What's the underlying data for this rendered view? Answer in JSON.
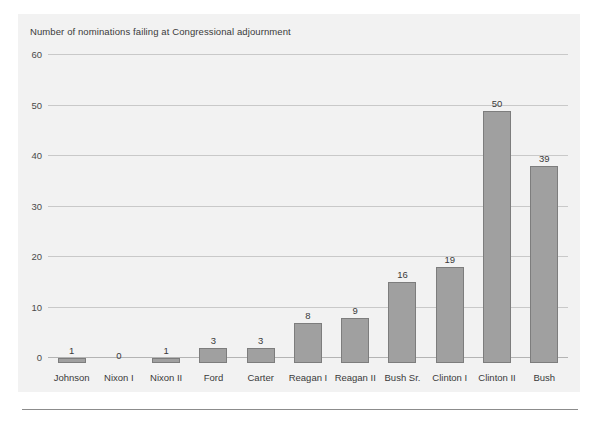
{
  "figure": {
    "title": "Number of nominations failing at Congressional adjournment"
  },
  "colors": {
    "panel_background": "#f2f2f2",
    "bar_fill": "#a0a0a0",
    "bar_border": "#7d7d7d",
    "gridline": "#c9c9c9",
    "baseline": "#b4b4b4",
    "text": "#3a3a3a",
    "bottom_rule": "#8c8c8c"
  },
  "chart_data": {
    "type": "bar",
    "title": "Number of nominations failing at Congressional adjournment",
    "xlabel": "",
    "ylabel": "",
    "ylim": [
      0,
      60
    ],
    "yticks": [
      0,
      10,
      20,
      30,
      40,
      50,
      60
    ],
    "ytick_labels": [
      "0",
      "10",
      "20",
      "30",
      "40",
      "50",
      "60"
    ],
    "grid": true,
    "legend": false,
    "data_labels": true,
    "categories": [
      "Johnson",
      "Nixon I",
      "Nixon II",
      "Ford",
      "Carter",
      "Reagan I",
      "Reagan II",
      "Bush Sr.",
      "Clinton I",
      "Clinton II",
      "Bush"
    ],
    "values": [
      1,
      0,
      1,
      3,
      3,
      8,
      9,
      16,
      19,
      50,
      39
    ],
    "value_labels": [
      "1",
      "0",
      "1",
      "3",
      "3",
      "8",
      "9",
      "16",
      "19",
      "50",
      "39"
    ]
  }
}
